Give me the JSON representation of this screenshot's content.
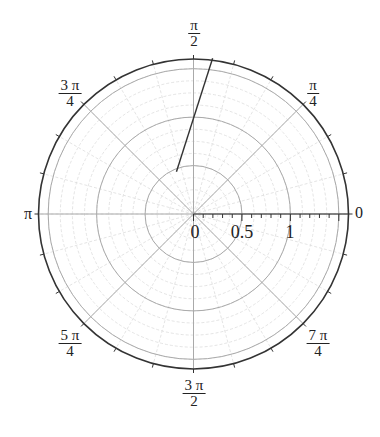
{
  "chart_data": {
    "type": "line",
    "projection": "polar",
    "title": "",
    "series": [
      {
        "name": "segment",
        "color": "#333333",
        "points_polar": [
          {
            "theta_deg": 112,
            "r": 0.47
          },
          {
            "theta_deg": 83,
            "r": 1.62
          }
        ]
      }
    ],
    "radial_axis": {
      "range": [
        0,
        1.6
      ],
      "tick_labels": [
        "0",
        "0.5",
        "1"
      ],
      "tick_values": [
        0,
        0.5,
        1
      ],
      "minor_tick_step": 0.1,
      "grid_circles": [
        0.5,
        1.0,
        1.5
      ],
      "minor_grid_step": 0.125
    },
    "angular_axis": {
      "major_spokes_deg": [
        0,
        45,
        90,
        135,
        180,
        225,
        270,
        315
      ],
      "tick_labels": [
        {
          "deg": 0,
          "num": "0",
          "den": ""
        },
        {
          "deg": 45,
          "num": "π",
          "den": "4"
        },
        {
          "deg": 90,
          "num": "π",
          "den": "2"
        },
        {
          "deg": 135,
          "num": "3 π",
          "den": "4"
        },
        {
          "deg": 180,
          "num": "π",
          "den": ""
        },
        {
          "deg": 225,
          "num": "5 π",
          "den": "4"
        },
        {
          "deg": 270,
          "num": "3 π",
          "den": "2"
        },
        {
          "deg": 315,
          "num": "7 π",
          "den": "4"
        }
      ],
      "minor_tick_step_deg": 15
    },
    "grid": true,
    "legend": "none"
  },
  "labels": {
    "angle_0": "0",
    "angle_pi": "π",
    "angle_pi_4_num": "π",
    "angle_pi_4_den": "4",
    "angle_pi_2_num": "π",
    "angle_pi_2_den": "2",
    "angle_3pi_4_num": "3 π",
    "angle_3pi_4_den": "4",
    "angle_5pi_4_num": "5 π",
    "angle_5pi_4_den": "4",
    "angle_3pi_2_num": "3 π",
    "angle_3pi_2_den": "2",
    "angle_7pi_4_num": "7 π",
    "angle_7pi_4_den": "4",
    "r_0": "0",
    "r_05": "0.5",
    "r_1": "1"
  },
  "style": {
    "outer_color": "#333333",
    "grid_color": "#aaaaaa",
    "minor_grid_color": "#dddddd",
    "line_color": "#333333"
  }
}
